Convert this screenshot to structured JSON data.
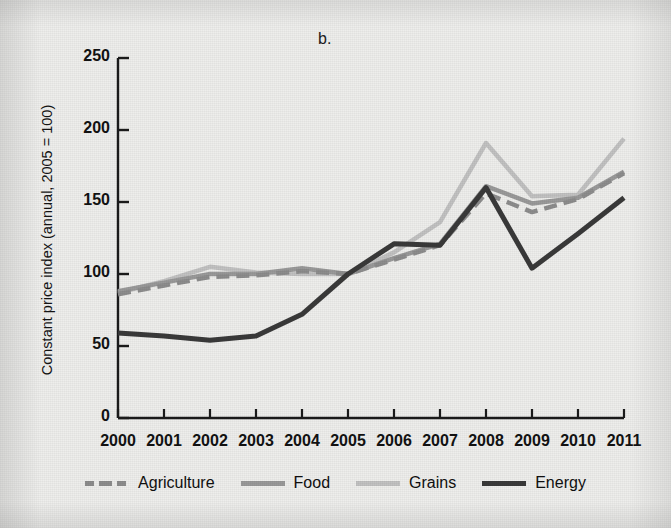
{
  "figure": {
    "panel_label": "b.",
    "background_color": "#eeeeec"
  },
  "chart_data": {
    "type": "line",
    "title": "b.",
    "xlabel": "",
    "ylabel": "Constant price index (annual, 2005 = 100)",
    "categories": [
      "2000",
      "2001",
      "2002",
      "2003",
      "2004",
      "2005",
      "2006",
      "2007",
      "2008",
      "2009",
      "2010",
      "2011"
    ],
    "x": [
      2000,
      2001,
      2002,
      2003,
      2004,
      2005,
      2006,
      2007,
      2008,
      2009,
      2010,
      2011
    ],
    "xlim": [
      2000,
      2011
    ],
    "ylim": [
      0,
      250
    ],
    "yticks": [
      0,
      50,
      100,
      150,
      200,
      250
    ],
    "grid": false,
    "legend_position": "bottom",
    "series": [
      {
        "name": "Agriculture",
        "color": "#8d8d8d",
        "style": "dashed",
        "width": 4.5,
        "values": [
          86,
          92,
          98,
          99,
          102,
          100,
          110,
          120,
          156,
          143,
          152,
          170
        ]
      },
      {
        "name": "Food",
        "color": "#9a9a9a",
        "style": "solid",
        "width": 4.5,
        "values": [
          88,
          94,
          100,
          100,
          104,
          100,
          111,
          121,
          161,
          149,
          153,
          171
        ]
      },
      {
        "name": "Grains",
        "color": "#c2c2c2",
        "style": "solid",
        "width": 4.5,
        "values": [
          87,
          95,
          105,
          101,
          100,
          100,
          115,
          136,
          191,
          154,
          155,
          194
        ]
      },
      {
        "name": "Energy",
        "color": "#3a3a3a",
        "style": "solid",
        "width": 5,
        "values": [
          59,
          57,
          54,
          57,
          72,
          100,
          121,
          120,
          160,
          104,
          128,
          153
        ]
      }
    ]
  },
  "axes": {
    "y_tick_labels": [
      "250",
      "200",
      "150",
      "100",
      "50",
      "0"
    ],
    "x_tick_labels": [
      "2000",
      "2001",
      "2002",
      "2003",
      "2004",
      "2005",
      "2006",
      "2007",
      "2008",
      "2009",
      "2010",
      "2011"
    ],
    "y_axis_title": "Constant price index (annual, 2005 = 100)"
  },
  "legend": {
    "items": [
      {
        "label": "Agriculture",
        "color": "#8d8d8d",
        "style": "dashed"
      },
      {
        "label": "Food",
        "color": "#9a9a9a",
        "style": "solid"
      },
      {
        "label": "Grains",
        "color": "#c2c2c2",
        "style": "solid"
      },
      {
        "label": "Energy",
        "color": "#3a3a3a",
        "style": "solid"
      }
    ]
  }
}
